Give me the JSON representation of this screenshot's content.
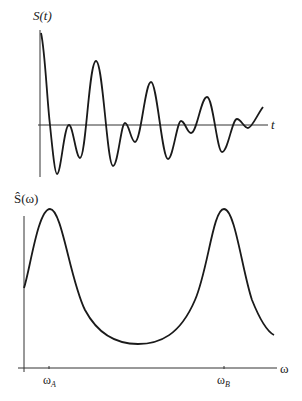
{
  "top_plot": {
    "y_label": "S(t)",
    "x_label": "t",
    "description": "Decaying oscillating time signal (beat pattern)"
  },
  "bottom_plot": {
    "y_label": "Ŝ(ω)",
    "x_label": "ω",
    "tick_labels": [
      "ω",
      "ω"
    ],
    "tick_subscripts": [
      "A",
      "B"
    ],
    "description": "Spectrum with two peaks at ωA and ωB"
  },
  "colors": {
    "line": "#1a1a1a",
    "axis": "#333333",
    "background": "#ffffff"
  }
}
